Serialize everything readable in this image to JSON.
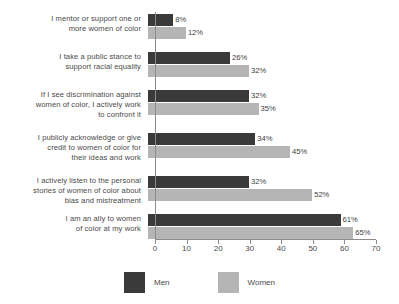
{
  "chart_data": {
    "type": "bar",
    "orientation": "horizontal",
    "title": "",
    "subtitle": "",
    "xlabel": "",
    "ylabel": "",
    "xlim": [
      0,
      70
    ],
    "xticks": [
      0,
      10,
      20,
      30,
      40,
      50,
      60,
      70
    ],
    "xtick_labels": [
      "0",
      "10",
      "20",
      "30",
      "40",
      "50",
      "60",
      "70"
    ],
    "grid": false,
    "legend_position": "bottom-center",
    "value_label_suffix": "%",
    "categories": [
      "I mentor or support one or\nmore women of color",
      "I take a public stance to\nsupport racial equality",
      "If I see discrimination against\nwomen of color, I actively work\nto confront it",
      "I publicly acknowledge or give\ncredit to women of color for\ntheir ideas and work",
      "I actively listen to the personal\nstories of women of color about\nbias and mistreatment",
      "I am an ally to women\nof color at my work"
    ],
    "series": [
      {
        "name": "Men",
        "color": "#3a3a3a",
        "values": [
          8,
          26,
          32,
          34,
          32,
          61
        ],
        "value_labels": [
          "8%",
          "26%",
          "32%",
          "34%",
          "32%",
          "61%"
        ]
      },
      {
        "name": "Women",
        "color": "#b5b5b5",
        "values": [
          12,
          32,
          35,
          45,
          52,
          65
        ],
        "value_labels": [
          "12%",
          "32%",
          "35%",
          "45%",
          "52%",
          "65%"
        ]
      }
    ]
  },
  "legend": {
    "items": [
      {
        "label": "Men",
        "color": "#3a3a3a"
      },
      {
        "label": "Women",
        "color": "#b5b5b5"
      }
    ]
  },
  "axis": {
    "color": "#8c8c8c"
  }
}
